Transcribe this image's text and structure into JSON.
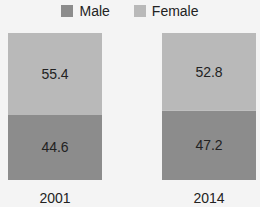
{
  "chart_data": {
    "type": "bar",
    "stacked": true,
    "title": "",
    "xlabel": "",
    "ylabel": "",
    "categories": [
      "2001",
      "2014"
    ],
    "series": [
      {
        "name": "Male",
        "values": [
          44.6,
          47.2
        ],
        "color": "#8c8c8c"
      },
      {
        "name": "Female",
        "values": [
          55.4,
          52.8
        ],
        "color": "#b9b9b9"
      }
    ],
    "ylim": [
      0,
      100
    ],
    "grid": false,
    "legend_position": "top-center",
    "data_labels": true
  }
}
